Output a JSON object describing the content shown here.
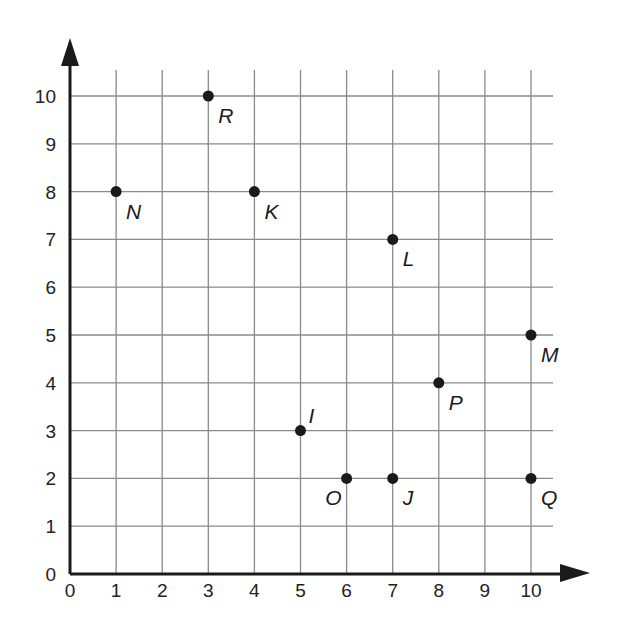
{
  "chart_data": {
    "type": "scatter",
    "title": "",
    "xlabel": "",
    "ylabel": "",
    "xlim": [
      0,
      10
    ],
    "ylim": [
      0,
      10
    ],
    "grid": true,
    "x_ticks": [
      "0",
      "1",
      "2",
      "3",
      "4",
      "5",
      "6",
      "7",
      "8",
      "9",
      "10"
    ],
    "y_ticks": [
      "0",
      "1",
      "2",
      "3",
      "4",
      "5",
      "6",
      "7",
      "8",
      "9",
      "10"
    ],
    "points": [
      {
        "label": "R",
        "x": 3,
        "y": 10,
        "label_pos": "below-right"
      },
      {
        "label": "N",
        "x": 1,
        "y": 8,
        "label_pos": "below-right"
      },
      {
        "label": "K",
        "x": 4,
        "y": 8,
        "label_pos": "below-right"
      },
      {
        "label": "L",
        "x": 7,
        "y": 7,
        "label_pos": "below-right"
      },
      {
        "label": "M",
        "x": 10,
        "y": 5,
        "label_pos": "below-right"
      },
      {
        "label": "P",
        "x": 8,
        "y": 4,
        "label_pos": "below-right"
      },
      {
        "label": "I",
        "x": 5,
        "y": 3,
        "label_pos": "above-right"
      },
      {
        "label": "O",
        "x": 6,
        "y": 2,
        "label_pos": "below-left"
      },
      {
        "label": "J",
        "x": 7,
        "y": 2,
        "label_pos": "below-right"
      },
      {
        "label": "Q",
        "x": 10,
        "y": 2,
        "label_pos": "below-right"
      }
    ],
    "legend": null
  },
  "style": {
    "axis_color": "#1a1a1a",
    "grid_color": "#8a8a8a",
    "point_color": "#1a1a1a"
  }
}
